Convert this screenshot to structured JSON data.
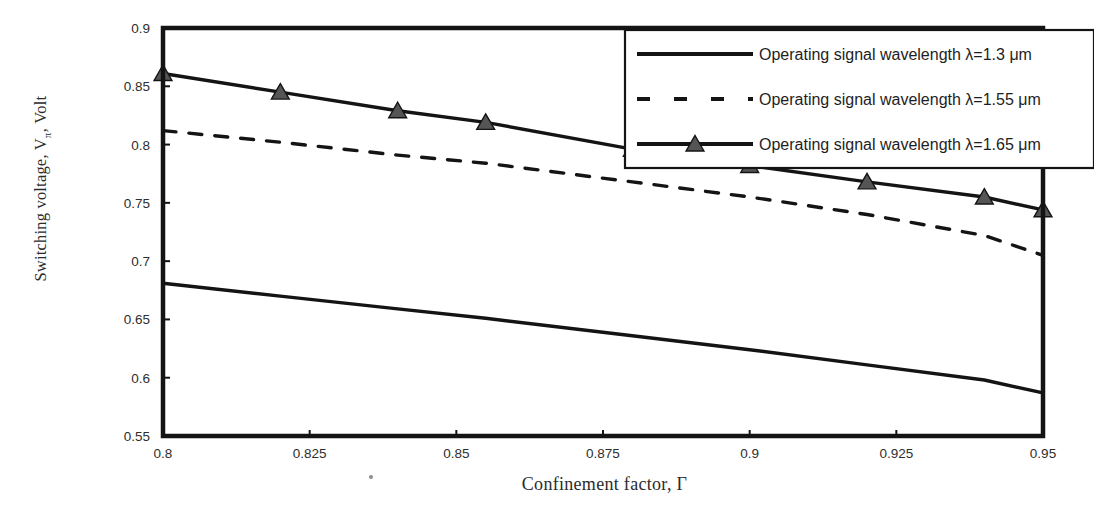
{
  "chart_data": {
    "type": "line",
    "title": "",
    "xlabel": "Confinement factor, Γ",
    "ylabel": "Switching voltage, Vπ, Volt",
    "ylabel_main": "Switching voltage, V",
    "ylabel_sub": "π",
    "ylabel_tail": ", Volt",
    "xlim": [
      0.8,
      0.95
    ],
    "ylim": [
      0.55,
      0.9
    ],
    "grid": false,
    "legend_position": "top-right",
    "xticks": [
      "0.8",
      "0.825",
      "0.85",
      "0.875",
      "0.9",
      "0.925",
      "0.95"
    ],
    "xtick_values": [
      0.8,
      0.825,
      0.85,
      0.875,
      0.9,
      0.925,
      0.95
    ],
    "yticks": [
      "0.55",
      "0.6",
      "0.65",
      "0.7",
      "0.75",
      "0.8",
      "0.85",
      "0.9"
    ],
    "ytick_values": [
      0.55,
      0.6,
      0.65,
      0.7,
      0.75,
      0.8,
      0.85,
      0.9
    ],
    "x": [
      0.8,
      0.82,
      0.84,
      0.855,
      0.88,
      0.9,
      0.92,
      0.94,
      0.95
    ],
    "series": [
      {
        "name": "Operating signal wavelength λ=1.3 μm",
        "style": "solid",
        "marker": "none",
        "color": "#141414",
        "values": [
          0.681,
          0.67,
          0.659,
          0.651,
          0.636,
          0.624,
          0.611,
          0.598,
          0.587
        ]
      },
      {
        "name": "Operating signal wavelength λ=1.55 μm",
        "style": "dashed",
        "marker": "none",
        "color": "#141414",
        "values": [
          0.812,
          0.802,
          0.791,
          0.784,
          0.768,
          0.755,
          0.74,
          0.722,
          0.705
        ]
      },
      {
        "name": "Operating signal wavelength λ=1.65 μm",
        "style": "solid",
        "marker": "triangle",
        "color": "#141414",
        "values": [
          0.861,
          0.845,
          0.829,
          0.819,
          0.796,
          0.782,
          0.768,
          0.755,
          0.744
        ]
      }
    ],
    "legend": [
      {
        "label": "Operating signal wavelength λ=1.3 μm",
        "style": "solid",
        "marker": "none"
      },
      {
        "label": "Operating signal wavelength λ=1.55 μm",
        "style": "dashed",
        "marker": "none"
      },
      {
        "label": "Operating signal wavelength λ=1.65 μm",
        "style": "solid",
        "marker": "triangle"
      }
    ]
  }
}
